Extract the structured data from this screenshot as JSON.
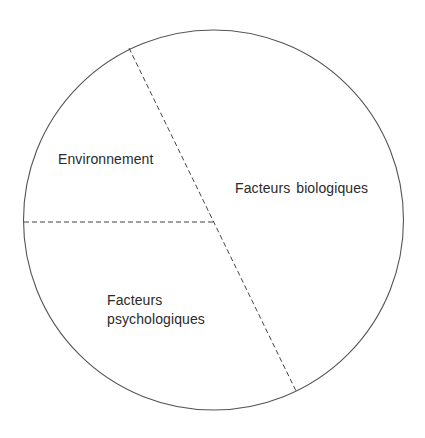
{
  "diagram": {
    "type": "pie-division",
    "colors": {
      "circle_stroke": "#555555",
      "divider_stroke": "#444444",
      "text": "#2a2a2a",
      "background": "#ffffff"
    },
    "segments": [
      {
        "name": "environnement",
        "label": "Environnement"
      },
      {
        "name": "facteurs-biologiques",
        "label": "Facteurs biologiques"
      },
      {
        "name": "facteurs-psychologiques",
        "label_line1": "Facteurs",
        "label_line2": "psychologiques"
      }
    ]
  }
}
